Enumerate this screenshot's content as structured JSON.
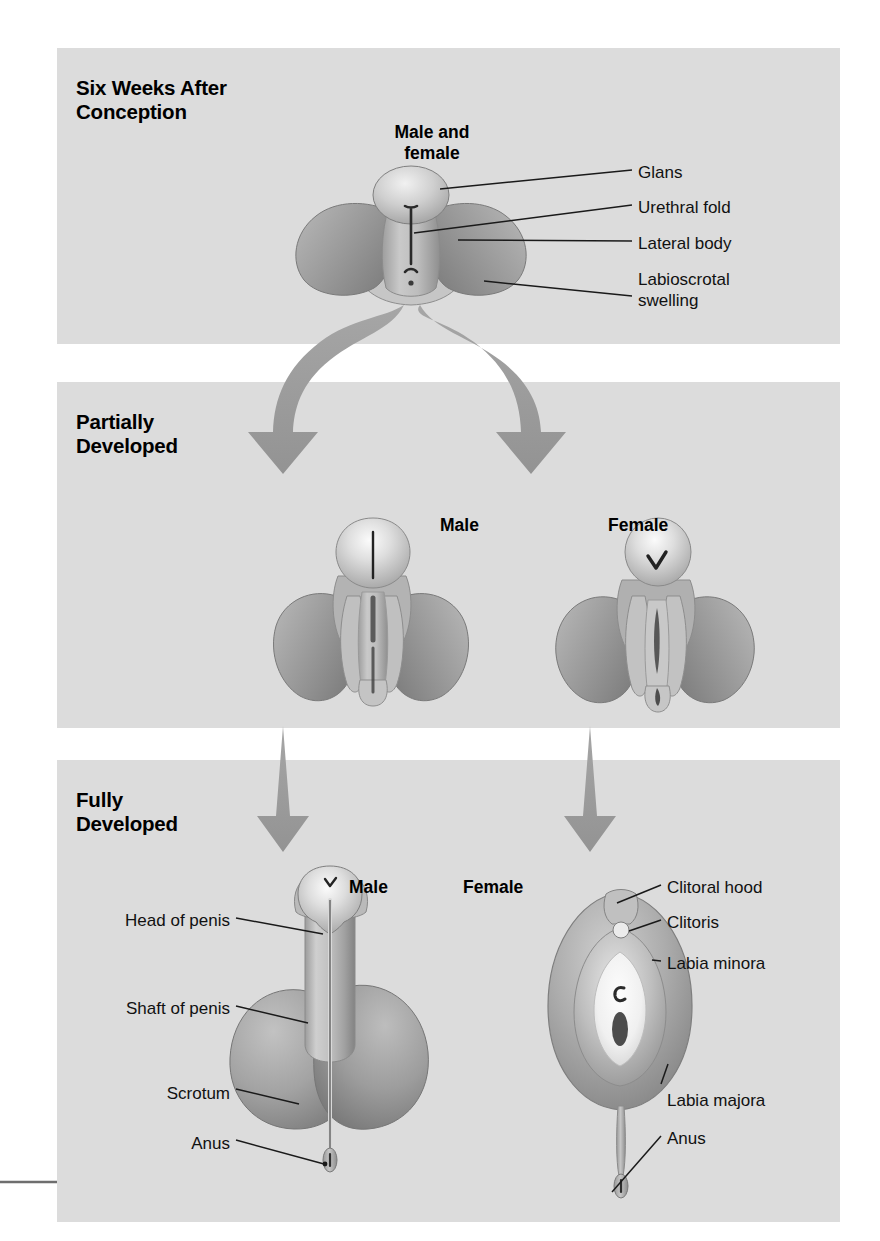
{
  "figure": {
    "type": "diagram",
    "background_color": "#ffffff",
    "panel_color": "#dcdcdc",
    "arrow_color": "#9a9a9a",
    "text_color": "#000000"
  },
  "panels": [
    {
      "id": "six-weeks",
      "title": "Six Weeks After\nConception",
      "figures": [
        {
          "id": "embryo",
          "caption": "Male and\nfemale"
        }
      ],
      "labels": [
        {
          "id": "glans",
          "text": "Glans"
        },
        {
          "id": "urethral-fold",
          "text": "Urethral fold"
        },
        {
          "id": "lateral-body",
          "text": "Lateral body"
        },
        {
          "id": "labioscrotal-swelling",
          "text": "Labioscrotal\nswelling"
        }
      ]
    },
    {
      "id": "partially-developed",
      "title": "Partially\nDeveloped",
      "figures": [
        {
          "id": "male",
          "caption": "Male"
        },
        {
          "id": "female",
          "caption": "Female"
        }
      ],
      "labels": []
    },
    {
      "id": "fully-developed",
      "title": "Fully\nDeveloped",
      "figures": [
        {
          "id": "male",
          "caption": "Male"
        },
        {
          "id": "female",
          "caption": "Female"
        }
      ],
      "labels_male": [
        {
          "id": "head-of-penis",
          "text": "Head of penis"
        },
        {
          "id": "shaft-of-penis",
          "text": "Shaft of penis"
        },
        {
          "id": "scrotum",
          "text": "Scrotum"
        },
        {
          "id": "anus",
          "text": "Anus"
        }
      ],
      "labels_female": [
        {
          "id": "clitoral-hood",
          "text": "Clitoral hood"
        },
        {
          "id": "clitoris",
          "text": "Clitoris"
        },
        {
          "id": "labia-minora",
          "text": "Labia minora"
        },
        {
          "id": "labia-majora",
          "text": "Labia majora"
        },
        {
          "id": "anus",
          "text": "Anus"
        }
      ]
    }
  ]
}
